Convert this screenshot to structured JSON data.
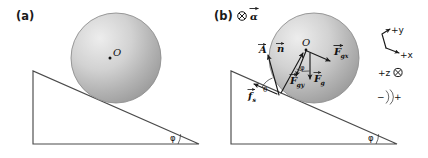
{
  "figure": {
    "background_color": "#ffffff",
    "ink_color": "#4a4a4a",
    "sphere_fill_light": "#e6e6e6",
    "sphere_fill_dark": "#9a9a9a",
    "width": 428,
    "height": 158
  },
  "panels": [
    {
      "id": "a",
      "label": "(a)",
      "center_point_label": "O",
      "incline_angle_label": "φ"
    },
    {
      "id": "b",
      "label": "(b)",
      "center_point_label": "O",
      "incline_angle_label": "φ",
      "angular_acceleration": {
        "symbol": "⊗",
        "label": "α",
        "has_vector_arrow": true,
        "meaning": "into-page-icon"
      },
      "vectors": [
        {
          "name": "A",
          "label": "A",
          "subscript": "",
          "has_vector_arrow": true,
          "description": "acceleration-vector"
        },
        {
          "name": "n",
          "label": "n",
          "subscript": "",
          "has_vector_arrow": true,
          "description": "normal-force-vector"
        },
        {
          "name": "Fgx",
          "label": "F",
          "subscript": "gx",
          "has_vector_arrow": true,
          "description": "gravity-x-component-vector"
        },
        {
          "name": "Fgy",
          "label": "F",
          "subscript": "gy",
          "has_vector_arrow": true,
          "description": "gravity-y-component-vector"
        },
        {
          "name": "Fg",
          "label": "F",
          "subscript": "g",
          "has_vector_arrow": true,
          "description": "gravity-force-vector"
        },
        {
          "name": "fs",
          "label": "f",
          "subscript": "s",
          "has_vector_arrow": true,
          "description": "static-friction-vector"
        }
      ],
      "angles": [
        {
          "name": "theta-contact",
          "label": "θ"
        },
        {
          "name": "phi-center",
          "label": "φ"
        }
      ]
    }
  ],
  "axes_legend": {
    "y_label": "+y",
    "x_label": "+x",
    "z_label": "+z",
    "z_symbol": "⊗",
    "rotation_negative": "−",
    "rotation_positive": "+"
  }
}
